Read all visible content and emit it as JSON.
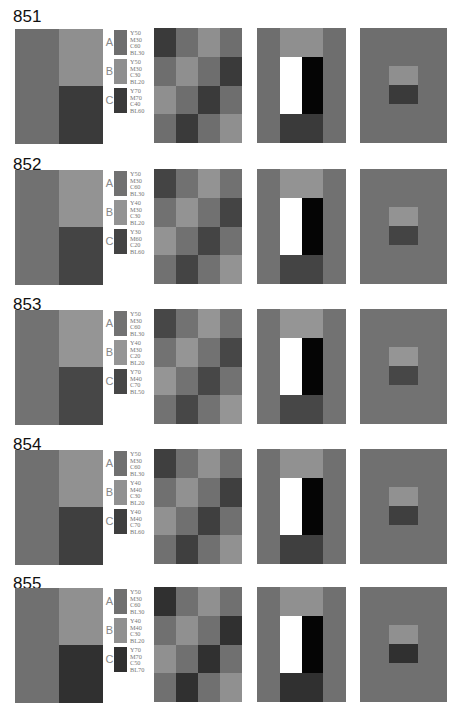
{
  "checker_pattern": [
    [
      "C",
      "A",
      "B",
      "A"
    ],
    [
      "A",
      "B",
      "A",
      "C"
    ],
    [
      "B",
      "A",
      "C",
      "A"
    ],
    [
      "A",
      "C",
      "A",
      "B"
    ]
  ],
  "blocks": [
    {
      "id": "851",
      "top": 8,
      "box_top": 29,
      "colors": {
        "A": "#6e6e6e",
        "B": "#8f8f8f",
        "C": "#3a3a3a"
      },
      "swatches": [
        {
          "letter": "A",
          "cmyk": [
            "Y50",
            "M30",
            "C60",
            "BL30"
          ]
        },
        {
          "letter": "B",
          "cmyk": [
            "Y50",
            "M30",
            "C30",
            "BL20"
          ]
        },
        {
          "letter": "C",
          "cmyk": [
            "Y70",
            "M70",
            "C40",
            "BL60"
          ]
        }
      ]
    },
    {
      "id": "852",
      "top": 156,
      "box_top": 170,
      "colors": {
        "A": "#717171",
        "B": "#939393",
        "C": "#444444"
      },
      "swatches": [
        {
          "letter": "A",
          "cmyk": [
            "Y50",
            "M30",
            "C60",
            "BL30"
          ]
        },
        {
          "letter": "B",
          "cmyk": [
            "Y40",
            "M30",
            "C30",
            "BL20"
          ]
        },
        {
          "letter": "C",
          "cmyk": [
            "Y30",
            "M60",
            "C20",
            "BL60"
          ]
        }
      ]
    },
    {
      "id": "853",
      "top": 296,
      "box_top": 310,
      "colors": {
        "A": "#727272",
        "B": "#959595",
        "C": "#474747"
      },
      "swatches": [
        {
          "letter": "A",
          "cmyk": [
            "Y50",
            "M30",
            "C60",
            "BL30"
          ]
        },
        {
          "letter": "B",
          "cmyk": [
            "Y40",
            "M30",
            "C20",
            "BL20"
          ]
        },
        {
          "letter": "C",
          "cmyk": [
            "Y70",
            "M40",
            "C70",
            "BL50"
          ]
        }
      ]
    },
    {
      "id": "854",
      "top": 436,
      "box_top": 450,
      "colors": {
        "A": "#707070",
        "B": "#919191",
        "C": "#3f3f3f"
      },
      "swatches": [
        {
          "letter": "A",
          "cmyk": [
            "Y50",
            "M30",
            "C60",
            "BL30"
          ]
        },
        {
          "letter": "B",
          "cmyk": [
            "Y40",
            "M40",
            "C30",
            "BL20"
          ]
        },
        {
          "letter": "C",
          "cmyk": [
            "Y40",
            "M40",
            "C70",
            "BL60"
          ]
        }
      ]
    },
    {
      "id": "855",
      "top": 575,
      "box_top": 588,
      "colors": {
        "A": "#707070",
        "B": "#909090",
        "C": "#303030"
      },
      "swatches": [
        {
          "letter": "A",
          "cmyk": [
            "Y50",
            "M30",
            "C60",
            "BL30"
          ]
        },
        {
          "letter": "B",
          "cmyk": [
            "Y40",
            "M40",
            "C30",
            "BL20"
          ]
        },
        {
          "letter": "C",
          "cmyk": [
            "Y70",
            "M70",
            "C50",
            "BL70"
          ]
        }
      ]
    }
  ]
}
